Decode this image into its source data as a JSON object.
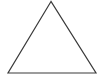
{
  "figure": {
    "shape": "triangle",
    "style": "outline",
    "stroke_color": "#3a3a3a",
    "fill_color": "#ffffff",
    "points": "51,1.5 8,73 96,73"
  }
}
